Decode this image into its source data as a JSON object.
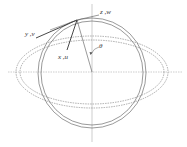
{
  "diagram": {
    "labels": {
      "z_w": "z ,w",
      "y_v": "y ,v",
      "x_u": "x ,u",
      "theta": "θ"
    },
    "colors": {
      "stroke": "#555555",
      "dashed": "#777777",
      "axis": "#999999",
      "text": "#333333",
      "background": "#ffffff"
    },
    "geometry": {
      "center": [
        92,
        72
      ],
      "circle_outer_r": 55,
      "circle_inner_r": 52,
      "ellipse_outer": [
        76,
        37
      ],
      "ellipse_inner": [
        72,
        33
      ],
      "point": [
        77,
        20
      ]
    }
  }
}
